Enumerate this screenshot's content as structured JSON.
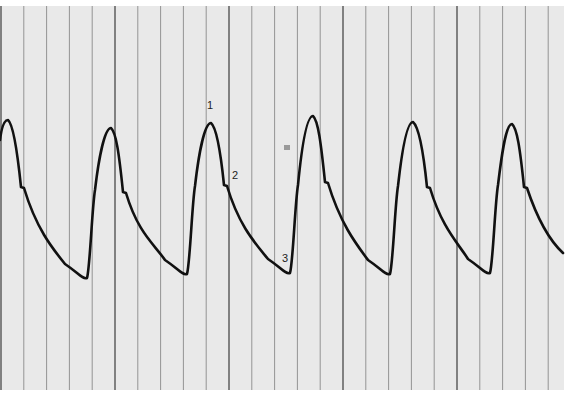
{
  "figure": {
    "annotations": [
      {
        "label": "1",
        "x": 211,
        "y": 107,
        "meaning": "systolic peak"
      },
      {
        "label": "2",
        "x": 236,
        "y": 176,
        "meaning": "dicrotic notch"
      },
      {
        "label": "3",
        "x": 286,
        "y": 259,
        "meaning": "end-diastole"
      }
    ]
  },
  "colors": {
    "paper": "#e9e9e9",
    "grid": "#8a8a8a",
    "trace": "#111111",
    "background": "#ffffff"
  },
  "grid": {
    "vertical_line_spacing_px": 22.8,
    "major_every": 5
  },
  "trace": {
    "cycles": 6,
    "peaks": [
      [
        8,
        120
      ],
      [
        111,
        128
      ],
      [
        211,
        123
      ],
      [
        313,
        116
      ],
      [
        413,
        122
      ],
      [
        512,
        124
      ]
    ],
    "notches": [
      [
        22,
        188
      ],
      [
        124,
        193
      ],
      [
        225,
        186
      ],
      [
        326,
        183
      ],
      [
        428,
        188
      ],
      [
        525,
        188
      ]
    ],
    "troughs": [
      [
        87,
        278
      ],
      [
        187,
        274
      ],
      [
        290,
        273
      ],
      [
        390,
        274
      ],
      [
        490,
        273
      ]
    ]
  }
}
